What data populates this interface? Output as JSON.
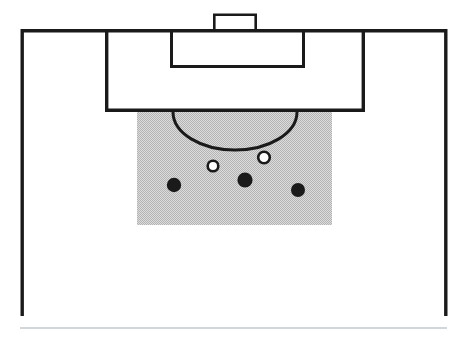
{
  "figure": {
    "type": "soccer-pitch-diagram",
    "title": "",
    "canvas": {
      "width": 461,
      "height": 340,
      "background": "#ffffff"
    },
    "colors": {
      "line": "#1a1a1a",
      "shaded_zone_fill": "#c9c9c9",
      "attacker_fill": "#1a1a1a",
      "defender_fill": "#ffffff",
      "defender_stroke": "#1a1a1a",
      "baseline_rule": "#c4c8cc"
    },
    "stroke_widths": {
      "pitch_boundary": 3.4,
      "penalty_area": 3.4,
      "goal_area": 3.0,
      "goal": 2.6,
      "penalty_arc": 3.0,
      "marker_outline": 2.6,
      "baseline_rule": 1.4
    }
  },
  "pitch": {
    "boundary": {
      "label": "pitch-boundary",
      "left": 20.5,
      "right": 447.5,
      "goal_line_y": 29.0,
      "bottom_y": 316.0
    },
    "penalty_area": {
      "label": "penalty-area",
      "x": 105.0,
      "y": 29.0,
      "width": 260.0,
      "height": 83.0
    },
    "goal_area": {
      "label": "goal-area-six-yard-box",
      "x": 170.0,
      "y": 29.0,
      "width": 135.0,
      "height": 39.0
    },
    "goal": {
      "label": "goal-frame",
      "x": 213.0,
      "y": 13.5,
      "width": 44.0,
      "height": 15.5
    },
    "penalty_arc": {
      "label": "penalty-arc-the-d",
      "center_x": 235.0,
      "center_y": 112.0,
      "radius_x": 62.0,
      "radius_y": 38.0,
      "sweep": "below-penalty-area-line"
    },
    "baseline_rule": {
      "label": "bottom-rule",
      "x1": 20.0,
      "x2": 447.0,
      "y": 328.0
    }
  },
  "shaded_zone": {
    "label": "highlighted-danger-zone",
    "x": 137.0,
    "y": 112.0,
    "width": 195.0,
    "height": 113.0,
    "fill": "#c9c9c9",
    "pattern": "fine-dotted-halftone"
  },
  "players": {
    "attackers": {
      "legend": "attacking-players",
      "style": "filled-black-circle",
      "markers": [
        {
          "id": "attacker-left",
          "cx": 174.0,
          "cy": 185.0,
          "r": 7.2
        },
        {
          "id": "attacker-centre",
          "cx": 245.0,
          "cy": 180.0,
          "r": 7.6
        },
        {
          "id": "attacker-right",
          "cx": 298.0,
          "cy": 190.0,
          "r": 7.0
        }
      ]
    },
    "defenders": {
      "legend": "defending-players",
      "style": "open-white-circle",
      "markers": [
        {
          "id": "defender-left",
          "cx": 213.0,
          "cy": 166.0,
          "r": 5.3
        },
        {
          "id": "defender-right",
          "cx": 264.0,
          "cy": 157.5,
          "r": 5.8
        }
      ]
    }
  },
  "chart_data": {
    "type": "scatter",
    "title": "",
    "xlabel": "",
    "ylabel": "",
    "xlim": [
      0,
      461
    ],
    "ylim": [
      340,
      0
    ],
    "grid": false,
    "legend": "none",
    "series": [
      {
        "name": "attacking-players",
        "marker": "filled-circle",
        "color": "#1a1a1a",
        "points": [
          {
            "x": 174,
            "y": 185
          },
          {
            "x": 245,
            "y": 180
          },
          {
            "x": 298,
            "y": 190
          }
        ]
      },
      {
        "name": "defending-players",
        "marker": "open-circle",
        "color": "#ffffff",
        "edgecolor": "#1a1a1a",
        "points": [
          {
            "x": 213,
            "y": 166
          },
          {
            "x": 264,
            "y": 157.5
          }
        ]
      }
    ]
  }
}
